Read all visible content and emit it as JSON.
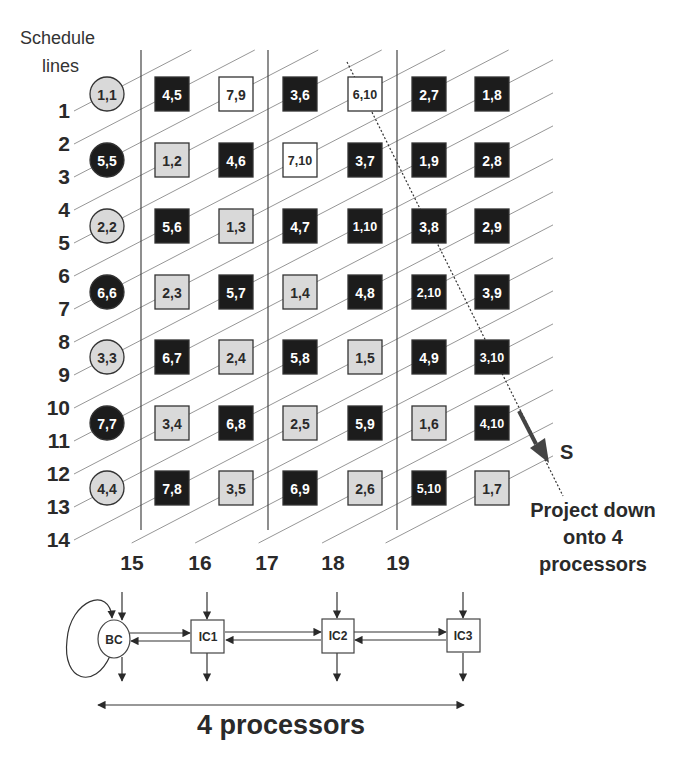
{
  "header": {
    "title_line1": "Schedule",
    "title_line2": "lines"
  },
  "schedule_lines": [
    "1",
    "2",
    "3",
    "4",
    "5",
    "6",
    "7",
    "8",
    "9",
    "10",
    "11",
    "12",
    "13",
    "14",
    "15",
    "16",
    "17",
    "18",
    "19"
  ],
  "grid": {
    "rows": [
      [
        {
          "label": "1,1",
          "style": "circle-gray"
        },
        {
          "label": "4,5",
          "style": "dark"
        },
        {
          "label": "7,9",
          "style": "white"
        },
        {
          "label": "3,6",
          "style": "dark"
        },
        {
          "label": "6,10",
          "style": "white"
        },
        {
          "label": "2,7",
          "style": "dark"
        },
        {
          "label": "1,8",
          "style": "dark"
        }
      ],
      [
        {
          "label": "5,5",
          "style": "circle-dark"
        },
        {
          "label": "1,2",
          "style": "gray"
        },
        {
          "label": "4,6",
          "style": "dark"
        },
        {
          "label": "7,10",
          "style": "white"
        },
        {
          "label": "3,7",
          "style": "dark"
        },
        {
          "label": "1,9",
          "style": "dark"
        },
        {
          "label": "2,8",
          "style": "dark"
        }
      ],
      [
        {
          "label": "2,2",
          "style": "circle-gray"
        },
        {
          "label": "5,6",
          "style": "dark"
        },
        {
          "label": "1,3",
          "style": "gray"
        },
        {
          "label": "4,7",
          "style": "dark"
        },
        {
          "label": "1,10",
          "style": "dark"
        },
        {
          "label": "3,8",
          "style": "dark"
        },
        {
          "label": "2,9",
          "style": "dark"
        }
      ],
      [
        {
          "label": "6,6",
          "style": "circle-dark"
        },
        {
          "label": "2,3",
          "style": "gray"
        },
        {
          "label": "5,7",
          "style": "dark"
        },
        {
          "label": "1,4",
          "style": "gray"
        },
        {
          "label": "4,8",
          "style": "dark"
        },
        {
          "label": "2,10",
          "style": "dark"
        },
        {
          "label": "3,9",
          "style": "dark"
        }
      ],
      [
        {
          "label": "3,3",
          "style": "circle-gray"
        },
        {
          "label": "6,7",
          "style": "dark"
        },
        {
          "label": "2,4",
          "style": "gray"
        },
        {
          "label": "5,8",
          "style": "dark"
        },
        {
          "label": "1,5",
          "style": "gray"
        },
        {
          "label": "4,9",
          "style": "dark"
        },
        {
          "label": "3,10",
          "style": "dark"
        }
      ],
      [
        {
          "label": "7,7",
          "style": "circle-dark"
        },
        {
          "label": "3,4",
          "style": "gray"
        },
        {
          "label": "6,8",
          "style": "dark"
        },
        {
          "label": "2,5",
          "style": "gray"
        },
        {
          "label": "5,9",
          "style": "dark"
        },
        {
          "label": "1,6",
          "style": "gray"
        },
        {
          "label": "4,10",
          "style": "dark"
        }
      ],
      [
        {
          "label": "4,4",
          "style": "circle-gray"
        },
        {
          "label": "7,8",
          "style": "dark"
        },
        {
          "label": "3,5",
          "style": "gray"
        },
        {
          "label": "6,9",
          "style": "dark"
        },
        {
          "label": "2,6",
          "style": "gray"
        },
        {
          "label": "5,10",
          "style": "dark"
        },
        {
          "label": "1,7",
          "style": "gray"
        }
      ]
    ]
  },
  "projection": {
    "direction_label": "S",
    "caption_line1": "Project down",
    "caption_line2": "onto 4",
    "caption_line3": "processors"
  },
  "processors": {
    "nodes": [
      "BC",
      "IC1",
      "IC2",
      "IC3"
    ],
    "span_label": "4 processors"
  },
  "colors": {
    "dark_fill": "#1c1c1c",
    "gray_fill": "#d9d9d9",
    "white_fill": "#ffffff",
    "stroke": "#333333",
    "schedule_line": "#8a8a8a"
  }
}
